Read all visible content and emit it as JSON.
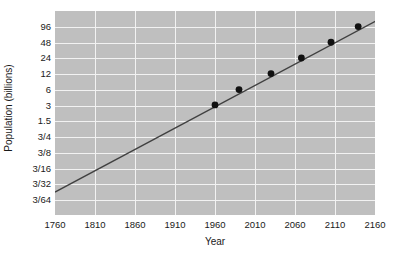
{
  "chart_data": {
    "type": "line",
    "title": "",
    "subtitle": "",
    "xlabel": "Year",
    "ylabel": "Population (billions)",
    "xlim": [
      1760,
      2160
    ],
    "ylim": [
      0.046875,
      144
    ],
    "yscale": "log2",
    "grid": true,
    "legend": null,
    "background_color": "#bfbfbf",
    "gridline_color": "#f2f2f2",
    "line_color": "#404040",
    "marker_color": "#111111",
    "xticks": [
      1760,
      1810,
      1860,
      1910,
      1960,
      2010,
      2060,
      2110,
      2160
    ],
    "xtick_labels": [
      "1760",
      "1810",
      "1860",
      "1910",
      "1960",
      "2010",
      "2060",
      "2110",
      "2160"
    ],
    "yticks": [
      96,
      48,
      24,
      12,
      6,
      3,
      1.5,
      0.75,
      0.375,
      0.1875,
      0.09375,
      0.046875
    ],
    "ytick_labels": [
      "96",
      "48",
      "24",
      "12",
      "6",
      "3",
      "1.5",
      "3/4",
      "3/8",
      "3/16",
      "3/32",
      "3/64"
    ],
    "series": [
      {
        "name": "Population trend",
        "type": "line",
        "x": [
          1760,
          2165
        ],
        "values": [
          0.0665,
          135.0
        ]
      },
      {
        "name": "Population data points",
        "type": "scatter",
        "x": [
          1960,
          1990,
          2030,
          2068,
          2105,
          2139
        ],
        "values": [
          3.1,
          6.1,
          12.3,
          24.5,
          49.0,
          98.0
        ]
      }
    ]
  },
  "figure": {
    "xlabel": "Year",
    "ylabel": "Population (billions)"
  }
}
